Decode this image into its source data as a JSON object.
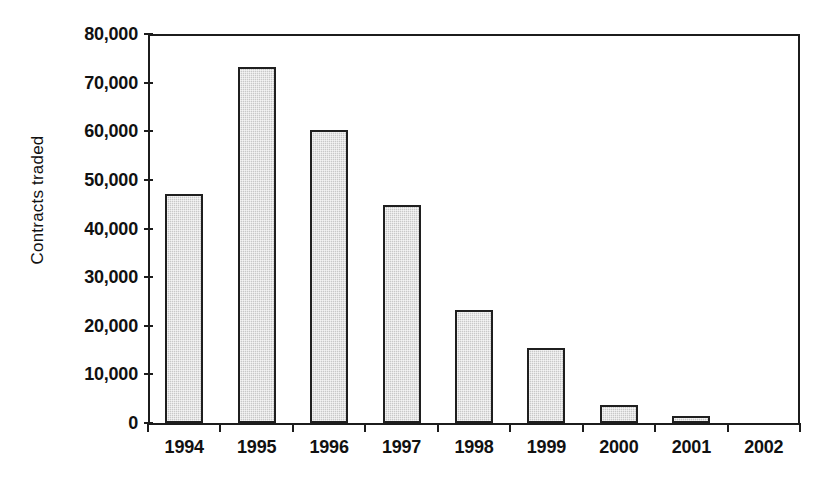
{
  "chart_data": {
    "type": "bar",
    "title": "",
    "xlabel": "",
    "ylabel": "Contracts traded",
    "categories": [
      "1994",
      "1995",
      "1996",
      "1997",
      "1998",
      "1999",
      "2000",
      "2001",
      "2002"
    ],
    "values": [
      47000,
      73300,
      60200,
      44800,
      23300,
      15400,
      3800,
      1400,
      0
    ],
    "ylim": [
      0,
      80000
    ],
    "ytick_labels": [
      "0",
      "10,000",
      "20,000",
      "30,000",
      "40,000",
      "50,000",
      "60,000",
      "70,000",
      "80,000"
    ],
    "ytick_values": [
      0,
      10000,
      20000,
      30000,
      40000,
      50000,
      60000,
      70000,
      80000
    ],
    "ytick_step": 10000,
    "grid": false,
    "legend": null,
    "bar_fill_color": "#c8c8c8",
    "bar_edge_color": "#1f1f1f",
    "axis_color": "#1c1c1c",
    "background_color": "#ffffff"
  }
}
